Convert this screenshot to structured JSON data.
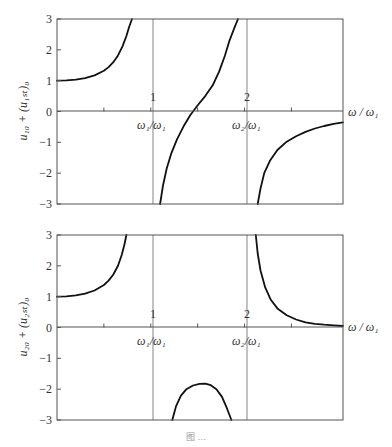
{
  "chart_data": [
    {
      "type": "line",
      "panel": "top",
      "title": "",
      "xlabel": "ω / ω₁",
      "ylabel": "u₁₀ + (u₁ₛₜ)₀",
      "xlim": [
        0,
        3.05
      ],
      "ylim": [
        -3,
        3
      ],
      "yticks": [
        3,
        2,
        1,
        0,
        -1,
        -2,
        -3
      ],
      "xticks": [
        0.5,
        1,
        1.5,
        2,
        2.5
      ],
      "xtick_labels": {
        "1": "1",
        "2": "2"
      },
      "markers": [
        {
          "x": 1,
          "label": "ω₁/ω₁"
        },
        {
          "x": 2,
          "label": "ω₂/ω₁"
        }
      ],
      "grid": false,
      "series": [
        {
          "name": "branch-1",
          "points": [
            [
              0,
              1.0
            ],
            [
              0.1,
              1.01
            ],
            [
              0.2,
              1.03
            ],
            [
              0.3,
              1.08
            ],
            [
              0.4,
              1.17
            ],
            [
              0.5,
              1.32
            ],
            [
              0.55,
              1.44
            ],
            [
              0.6,
              1.6
            ],
            [
              0.65,
              1.82
            ],
            [
              0.7,
              2.12
            ],
            [
              0.74,
              2.45
            ],
            [
              0.77,
              2.75
            ],
            [
              0.8,
              3.0
            ]
          ]
        },
        {
          "name": "branch-2",
          "points": [
            [
              1.1,
              -3.0
            ],
            [
              1.13,
              -2.4
            ],
            [
              1.17,
              -1.85
            ],
            [
              1.22,
              -1.35
            ],
            [
              1.28,
              -0.9
            ],
            [
              1.35,
              -0.48
            ],
            [
              1.42,
              -0.12
            ],
            [
              1.45,
              0.0
            ],
            [
              1.5,
              0.2
            ],
            [
              1.58,
              0.5
            ],
            [
              1.66,
              0.85
            ],
            [
              1.73,
              1.3
            ],
            [
              1.79,
              1.8
            ],
            [
              1.84,
              2.3
            ],
            [
              1.89,
              2.7
            ],
            [
              1.93,
              3.0
            ]
          ]
        },
        {
          "name": "branch-3",
          "points": [
            [
              2.14,
              -3.0
            ],
            [
              2.17,
              -2.5
            ],
            [
              2.21,
              -2.0
            ],
            [
              2.27,
              -1.6
            ],
            [
              2.35,
              -1.25
            ],
            [
              2.45,
              -0.98
            ],
            [
              2.55,
              -0.8
            ],
            [
              2.65,
              -0.66
            ],
            [
              2.75,
              -0.55
            ],
            [
              2.85,
              -0.47
            ],
            [
              2.95,
              -0.4
            ],
            [
              3.05,
              -0.35
            ]
          ]
        }
      ]
    },
    {
      "type": "line",
      "panel": "bottom",
      "title": "",
      "xlabel": "ω / ω₁",
      "ylabel": "u₂₀ + (u₂ₛₜ)₀",
      "xlim": [
        0,
        3.05
      ],
      "ylim": [
        -3,
        3
      ],
      "yticks": [
        3,
        2,
        1,
        0,
        -1,
        -2,
        -3
      ],
      "xticks": [
        0.5,
        1,
        1.5,
        2,
        2.5
      ],
      "xtick_labels": {
        "1": "1",
        "2": "2"
      },
      "markers": [
        {
          "x": 1,
          "label": "ω₁/ω₁"
        },
        {
          "x": 2,
          "label": "ω₂/ω₁"
        }
      ],
      "grid": false,
      "series": [
        {
          "name": "branch-1",
          "points": [
            [
              0,
              1.0
            ],
            [
              0.1,
              1.01
            ],
            [
              0.2,
              1.04
            ],
            [
              0.3,
              1.1
            ],
            [
              0.4,
              1.2
            ],
            [
              0.5,
              1.38
            ],
            [
              0.55,
              1.52
            ],
            [
              0.6,
              1.72
            ],
            [
              0.65,
              2.0
            ],
            [
              0.69,
              2.35
            ],
            [
              0.72,
              2.7
            ],
            [
              0.74,
              3.0
            ]
          ]
        },
        {
          "name": "branch-2",
          "points": [
            [
              1.23,
              -3.0
            ],
            [
              1.27,
              -2.55
            ],
            [
              1.32,
              -2.22
            ],
            [
              1.38,
              -2.0
            ],
            [
              1.45,
              -1.88
            ],
            [
              1.52,
              -1.83
            ],
            [
              1.58,
              -1.82
            ],
            [
              1.64,
              -1.87
            ],
            [
              1.7,
              -2.0
            ],
            [
              1.76,
              -2.25
            ],
            [
              1.81,
              -2.6
            ],
            [
              1.86,
              -3.0
            ]
          ]
        },
        {
          "name": "branch-3",
          "points": [
            [
              2.12,
              3.0
            ],
            [
              2.14,
              2.4
            ],
            [
              2.17,
              1.85
            ],
            [
              2.22,
              1.3
            ],
            [
              2.28,
              0.9
            ],
            [
              2.35,
              0.62
            ],
            [
              2.45,
              0.4
            ],
            [
              2.55,
              0.26
            ],
            [
              2.65,
              0.17
            ],
            [
              2.75,
              0.12
            ],
            [
              2.85,
              0.09
            ],
            [
              2.95,
              0.07
            ],
            [
              3.05,
              0.05
            ]
          ]
        }
      ]
    }
  ],
  "labels": {
    "top_ylabel_main": "u",
    "top_ylabel_text": "u₁₀ + (u₁ₛₜ)₀",
    "bottom_ylabel_text": "u₂₀ + (u₂ₛₜ)₀",
    "xlabel": "ω / ω₁",
    "marker_1": "ω₁/ω₁",
    "marker_2": "ω₂/ω₁",
    "tick_1": "1",
    "tick_2": "2",
    "caption": "图 …"
  }
}
